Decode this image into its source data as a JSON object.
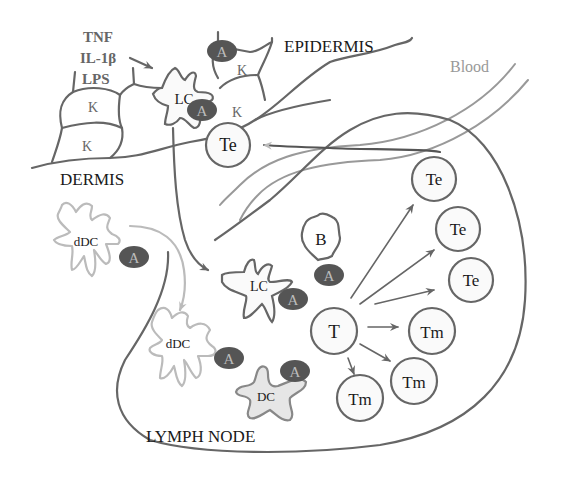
{
  "diagram": {
    "regions": {
      "epidermis": "EPIDERMIS",
      "dermis": "DERMIS",
      "lymph_node": "LYMPH NODE",
      "blood": "Blood"
    },
    "stimuli": [
      "TNF",
      "IL-1β",
      "LPS"
    ],
    "cells": {
      "keratinocyte": "K",
      "langerhans_cell": "LC",
      "dermal_dc": "dDC",
      "dendritic_cell": "DC",
      "b_cell": "B",
      "t_cell": "T",
      "effector_t": "Te",
      "memory_t": "Tm",
      "antigen": "A"
    },
    "colors": {
      "line": "#666666",
      "light_line": "#bbbbbb",
      "antigen_fill": "#555555",
      "dc_fill": "#e6e6e6"
    }
  }
}
